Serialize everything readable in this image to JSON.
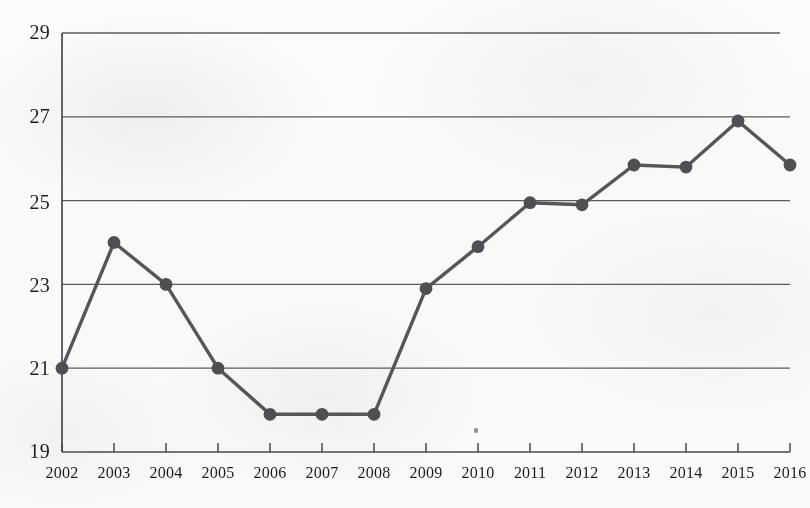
{
  "chart_data": {
    "type": "line",
    "title": "",
    "subtitle": "",
    "xlabel": "",
    "ylabel": "",
    "categories": [
      "2002",
      "2003",
      "2004",
      "2005",
      "2006",
      "2007",
      "2008",
      "2009",
      "2010",
      "2011",
      "2012",
      "2013",
      "2014",
      "2015",
      "2016"
    ],
    "values": [
      21.0,
      24.0,
      23.0,
      21.0,
      19.9,
      19.9,
      19.9,
      22.9,
      23.9,
      24.95,
      24.9,
      25.85,
      25.8,
      26.9,
      25.85
    ],
    "series": [
      {
        "name": "series-1",
        "values": [
          21.0,
          24.0,
          23.0,
          21.0,
          19.9,
          19.9,
          19.9,
          22.9,
          23.9,
          24.95,
          24.9,
          25.85,
          25.8,
          26.9,
          25.85
        ]
      }
    ],
    "ylim": [
      19,
      29
    ],
    "xlim": [
      2002,
      2016
    ],
    "yticks": [
      19,
      21,
      23,
      25,
      27,
      29
    ],
    "ytick_labels": [
      "19",
      "21",
      "23",
      "25",
      "27",
      "29"
    ],
    "xticks": [
      2002,
      2003,
      2004,
      2005,
      2006,
      2007,
      2008,
      2009,
      2010,
      2011,
      2012,
      2013,
      2014,
      2015,
      2016
    ],
    "xtick_labels": [
      "2002",
      "2003",
      "2004",
      "2005",
      "2006",
      "2007",
      "2008",
      "2009",
      "2010",
      "2011",
      "2012",
      "2013",
      "2014",
      "2015",
      "2016"
    ],
    "grid": "horizontal",
    "legend": "none",
    "legend_position": "none",
    "annotations": [],
    "marker": "circle",
    "colors": {
      "line": "#55555a",
      "marker": "#4e4e53",
      "grid": "#5a5a5e",
      "axis": "#4a4a4e",
      "text": "#1d1d1f",
      "background": "#fdfdfd"
    }
  },
  "axes": {
    "y_tick_labels": [
      "29",
      "27",
      "25",
      "23",
      "21",
      "19"
    ],
    "x_tick_labels": [
      "2002",
      "2003",
      "2004",
      "2005",
      "2006",
      "2007",
      "2008",
      "2009",
      "2010",
      "2011",
      "2012",
      "2013",
      "2014",
      "2015",
      "2016"
    ]
  }
}
